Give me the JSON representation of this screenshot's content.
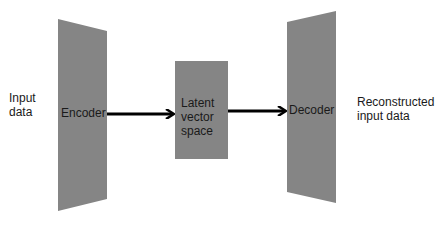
{
  "diagram": {
    "colors": {
      "block_fill": "#858585",
      "arrow": "#000000",
      "text": "#1a1a1a",
      "background": "#ffffff"
    },
    "nodes": [
      {
        "id": "input",
        "label_lines": [
          "Input",
          "data"
        ],
        "shape": "text"
      },
      {
        "id": "encoder",
        "label": "Encoder",
        "shape": "trapezoid-narrowing-right"
      },
      {
        "id": "latent",
        "label_lines": [
          "Latent",
          "vector",
          "space"
        ],
        "shape": "rectangle"
      },
      {
        "id": "decoder",
        "label": "Decoder",
        "shape": "trapezoid-widening-right"
      },
      {
        "id": "output",
        "label_lines": [
          "Reconstructed",
          "input data"
        ],
        "shape": "text"
      }
    ],
    "edges": [
      {
        "from": "encoder",
        "to": "latent"
      },
      {
        "from": "latent",
        "to": "decoder"
      }
    ]
  },
  "labels": {
    "input_line1": "Input",
    "input_line2": "data",
    "encoder": "Encoder",
    "latent_line1": "Latent",
    "latent_line2": "vector",
    "latent_line3": "space",
    "decoder": "Decoder",
    "output_line1": "Reconstructed",
    "output_line2": "input data"
  }
}
